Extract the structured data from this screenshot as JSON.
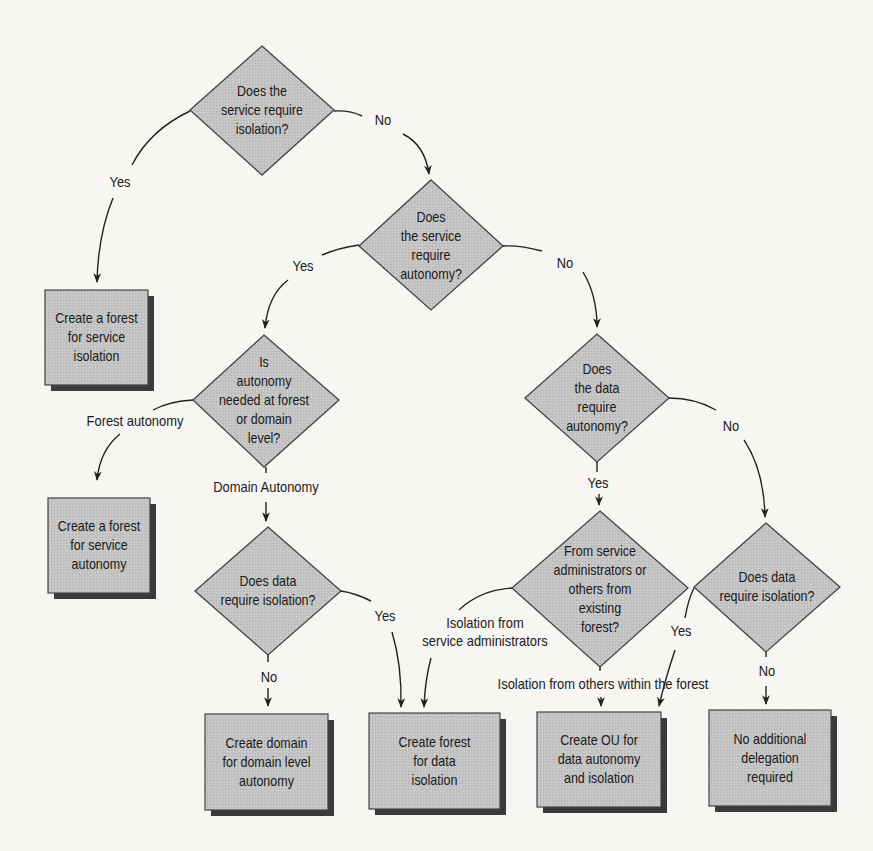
{
  "diagram": {
    "type": "flowchart",
    "colors": {
      "node_fill": "#c2c2c2",
      "node_stroke": "#444444",
      "shadow": "#333333",
      "line": "#222222",
      "background": "#f7f6f3"
    },
    "decisions": [
      {
        "id": "d1",
        "text": "Does the\nservice require\nisolation?"
      },
      {
        "id": "d2",
        "text": "Does\nthe service\nrequire\nautonomy?"
      },
      {
        "id": "d3",
        "text": "Is\nautonomy\nneeded at forest\nor domain\nlevel?"
      },
      {
        "id": "d4",
        "text": "Does data\nrequire isolation?"
      },
      {
        "id": "d5",
        "text": "Does\nthe data\nrequire\nautonomy?"
      },
      {
        "id": "d6",
        "text": "From service\nadministrators or\nothers from\nexisting\nforest?"
      },
      {
        "id": "d7",
        "text": "Does data\nrequire isolation?"
      }
    ],
    "outcomes": [
      {
        "id": "b1",
        "text": "Create a forest\nfor service\nisolation"
      },
      {
        "id": "b2",
        "text": "Create a forest\nfor service\nautonomy"
      },
      {
        "id": "b3",
        "text": "Create domain\nfor domain level\nautonomy"
      },
      {
        "id": "b4",
        "text": "Create forest\nfor data\nisolation"
      },
      {
        "id": "b5",
        "text": "Create OU for\ndata autonomy\nand isolation"
      },
      {
        "id": "b6",
        "text": "No additional\ndelegation\nrequired"
      }
    ],
    "edge_labels": {
      "d1_yes": "Yes",
      "d1_no": "No",
      "d2_yes": "Yes",
      "d2_no": "No",
      "d3_forest": "Forest autonomy",
      "d3_domain": "Domain Autonomy",
      "d4_yes": "Yes",
      "d4_no": "No",
      "d5_yes": "Yes",
      "d5_no": "No",
      "d6_service_admins": "Isolation from\nservice administrators",
      "d6_others": "Isolation from others within the forest",
      "d7_yes": "Yes",
      "d7_no": "No"
    }
  }
}
